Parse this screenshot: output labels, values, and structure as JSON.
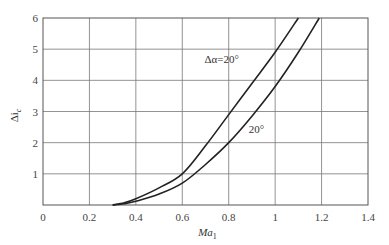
{
  "chart_data": {
    "type": "line",
    "title": "",
    "xlabel": "Ma",
    "xlabel_sub": "1",
    "ylabel": "Δi",
    "ylabel_sub": "c",
    "xlim": [
      0,
      1.4
    ],
    "ylim": [
      0,
      6
    ],
    "grid": true,
    "x_ticks": [
      "0",
      "0.2",
      "0.4",
      "0.6",
      "0.8",
      "1",
      "1.2",
      "1.4"
    ],
    "x_tick_values": [
      0,
      0.2,
      0.4,
      0.6,
      0.8,
      1.0,
      1.2,
      1.4
    ],
    "y_ticks": [
      "1",
      "2",
      "3",
      "4",
      "5",
      "6"
    ],
    "y_tick_values": [
      1,
      2,
      3,
      4,
      5,
      6
    ],
    "series": [
      {
        "name": "Δα=20°",
        "label": "Δα=20°",
        "x": [
          0.3,
          0.35,
          0.4,
          0.5,
          0.6,
          0.7,
          0.8,
          0.9,
          1.0,
          1.1
        ],
        "values": [
          0.0,
          0.07,
          0.2,
          0.55,
          1.0,
          1.9,
          2.9,
          3.9,
          4.9,
          6.0
        ]
      },
      {
        "name": "20°",
        "label": "20°",
        "x": [
          0.3,
          0.35,
          0.4,
          0.5,
          0.6,
          0.7,
          0.8,
          0.9,
          1.0,
          1.1,
          1.19
        ],
        "values": [
          0.0,
          0.04,
          0.12,
          0.35,
          0.7,
          1.3,
          2.0,
          2.85,
          3.8,
          4.9,
          6.0
        ]
      }
    ],
    "annotations": [
      {
        "text": "Δα=20°",
        "x": 0.77,
        "y": 4.55
      },
      {
        "text": "20°",
        "x": 0.92,
        "y": 2.3
      }
    ]
  }
}
